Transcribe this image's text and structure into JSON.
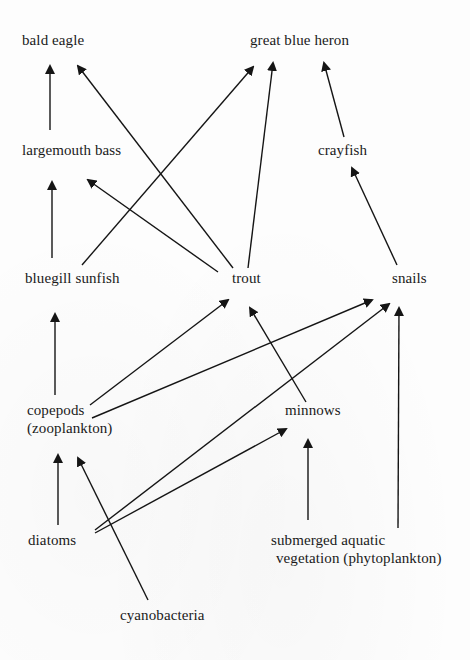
{
  "diagram": {
    "title": "",
    "type": "food web",
    "nodes": [
      {
        "id": "bald_eagle",
        "lines": [
          "bald eagle"
        ],
        "x": 22,
        "y": 31
      },
      {
        "id": "great_blue_heron",
        "lines": [
          "great blue heron"
        ],
        "x": 250,
        "y": 31
      },
      {
        "id": "largemouth_bass",
        "lines": [
          "largemouth bass"
        ],
        "x": 22,
        "y": 141
      },
      {
        "id": "crayfish",
        "lines": [
          "crayfish"
        ],
        "x": 318,
        "y": 141
      },
      {
        "id": "bluegill_sunfish",
        "lines": [
          "bluegill sunfish"
        ],
        "x": 25,
        "y": 269
      },
      {
        "id": "trout",
        "lines": [
          "trout"
        ],
        "x": 232,
        "y": 269
      },
      {
        "id": "snails",
        "lines": [
          "snails"
        ],
        "x": 392,
        "y": 269
      },
      {
        "id": "copepods",
        "lines": [
          "copepods",
          "(zooplankton)"
        ],
        "x": 27,
        "y": 401
      },
      {
        "id": "minnows",
        "lines": [
          "minnows"
        ],
        "x": 285,
        "y": 401
      },
      {
        "id": "diatoms",
        "lines": [
          "diatoms"
        ],
        "x": 28,
        "y": 531
      },
      {
        "id": "submerged_aquatic_vegetation",
        "lines": [
          "submerged aquatic",
          " vegetation (phytoplankton)"
        ],
        "x": 271,
        "y": 531
      },
      {
        "id": "cyanobacteria",
        "lines": [
          "cyanobacteria"
        ],
        "x": 120,
        "y": 606
      }
    ],
    "edges": [
      {
        "from": "largemouth_bass",
        "to": "bald_eagle",
        "x1": 50,
        "y1": 130,
        "x2": 50,
        "y2": 66
      },
      {
        "from": "trout",
        "to": "bald_eagle",
        "x1": 233,
        "y1": 268,
        "x2": 78,
        "y2": 66
      },
      {
        "from": "bluegill_sunfish",
        "to": "great_blue_heron",
        "x1": 82,
        "y1": 265,
        "x2": 253,
        "y2": 67
      },
      {
        "from": "trout",
        "to": "great_blue_heron",
        "x1": 248,
        "y1": 268,
        "x2": 273,
        "y2": 63
      },
      {
        "from": "crayfish",
        "to": "great_blue_heron",
        "x1": 344,
        "y1": 137,
        "x2": 324,
        "y2": 63
      },
      {
        "from": "bluegill_sunfish",
        "to": "largemouth_bass",
        "x1": 52,
        "y1": 258,
        "x2": 52,
        "y2": 182
      },
      {
        "from": "trout",
        "to": "largemouth_bass",
        "x1": 218,
        "y1": 272,
        "x2": 88,
        "y2": 180
      },
      {
        "from": "snails",
        "to": "crayfish",
        "x1": 397,
        "y1": 265,
        "x2": 352,
        "y2": 168
      },
      {
        "from": "copepods",
        "to": "bluegill_sunfish",
        "x1": 55,
        "y1": 395,
        "x2": 55,
        "y2": 314
      },
      {
        "from": "copepods",
        "to": "trout",
        "x1": 90,
        "y1": 405,
        "x2": 228,
        "y2": 300
      },
      {
        "from": "minnows",
        "to": "trout",
        "x1": 306,
        "y1": 402,
        "x2": 250,
        "y2": 308
      },
      {
        "from": "copepods",
        "to": "snails",
        "x1": 92,
        "y1": 418,
        "x2": 372,
        "y2": 300
      },
      {
        "from": "diatoms",
        "to": "snails",
        "x1": 95,
        "y1": 530,
        "x2": 389,
        "y2": 304
      },
      {
        "from": "submerged_aquatic_vegetation",
        "to": "snails",
        "x1": 398,
        "y1": 528,
        "x2": 399,
        "y2": 308
      },
      {
        "from": "diatoms",
        "to": "copepods",
        "x1": 58,
        "y1": 525,
        "x2": 58,
        "y2": 455
      },
      {
        "from": "cyanobacteria",
        "to": "copepods",
        "x1": 148,
        "y1": 600,
        "x2": 78,
        "y2": 458
      },
      {
        "from": "diatoms",
        "to": "minnows",
        "x1": 95,
        "y1": 533,
        "x2": 286,
        "y2": 429
      },
      {
        "from": "submerged_aquatic_vegetation",
        "to": "minnows",
        "x1": 308,
        "y1": 520,
        "x2": 308,
        "y2": 440
      }
    ],
    "colors": {
      "background": "#fdfdfd",
      "line": "#151515",
      "text": "#1a1a1a"
    }
  }
}
